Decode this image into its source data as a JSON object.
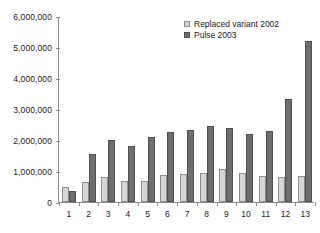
{
  "chart_data": {
    "type": "bar",
    "title": "",
    "xlabel": "",
    "ylabel": "",
    "grid": false,
    "legend_position": "top-right",
    "categories": [
      "1",
      "2",
      "3",
      "4",
      "5",
      "6",
      "7",
      "8",
      "9",
      "10",
      "11",
      "12",
      "13"
    ],
    "ylim": [
      0,
      6000000
    ],
    "yticks": [
      0,
      1000000,
      2000000,
      3000000,
      4000000,
      5000000,
      6000000
    ],
    "ytick_labels": [
      "0",
      "1,000,000",
      "2,000,000",
      "3,000,000",
      "4,000,000",
      "5,000,000",
      "6,000,000"
    ],
    "series": [
      {
        "name": "Replaced variant 2002",
        "color": "#d6d6d6",
        "values": [
          470000,
          640000,
          800000,
          690000,
          670000,
          880000,
          900000,
          930000,
          1050000,
          940000,
          850000,
          810000,
          840000
        ]
      },
      {
        "name": "Pulse 2003",
        "color": "#6e6e6e",
        "values": [
          350000,
          1560000,
          2000000,
          1810000,
          2110000,
          2260000,
          2320000,
          2450000,
          2380000,
          2200000,
          2290000,
          3320000,
          5200000
        ]
      }
    ]
  },
  "legend": {
    "items": [
      {
        "label": "Replaced variant 2002",
        "swatch": "light-swatch-icon"
      },
      {
        "label": "Pulse 2003",
        "swatch": "dark-swatch-icon"
      }
    ]
  }
}
